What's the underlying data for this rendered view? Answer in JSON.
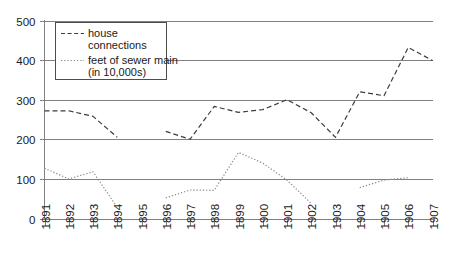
{
  "chart_data": {
    "type": "line",
    "title": "",
    "xlabel": "",
    "ylabel": "",
    "ylim": [
      0,
      500
    ],
    "yticks": [
      0,
      100,
      200,
      300,
      400,
      500
    ],
    "ytick_labels": [
      "0",
      "100",
      "200",
      "300",
      "400",
      "500"
    ],
    "grid": true,
    "legend_position": "upper-left",
    "categories": [
      "1891",
      "1892",
      "1893",
      "1894",
      "1895",
      "1896",
      "1897",
      "1898",
      "1899",
      "1900",
      "1901",
      "1902",
      "1903",
      "1904",
      "1905",
      "1906",
      "1907"
    ],
    "series": [
      {
        "name": "house connections",
        "style": "dashed",
        "color": "#3c3c3c",
        "values": [
          272,
          272,
          258,
          205,
          null,
          220,
          200,
          283,
          268,
          275,
          300,
          267,
          205,
          320,
          310,
          432,
          399
        ]
      },
      {
        "name": "feet of sewer main (in 10,000s)",
        "style": "dotted",
        "color": "#8c8c8c",
        "values": [
          127,
          100,
          118,
          28,
          null,
          52,
          72,
          71,
          167,
          140,
          97,
          38,
          null,
          78,
          97,
          103,
          null
        ]
      }
    ],
    "legend": [
      {
        "label_line1": "house",
        "label_line2": "connections",
        "style": "dashed"
      },
      {
        "label_line1": "feet of sewer main",
        "label_line2": "(in 10,000s)",
        "style": "dotted"
      }
    ]
  }
}
